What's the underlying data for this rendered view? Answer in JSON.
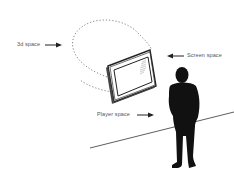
{
  "diagram": {
    "labels": {
      "space_3d": "3d space",
      "screen_space": "Screen space",
      "player_space": "Player space"
    },
    "elements": [
      "3d space dotted volume",
      "screen / monitor",
      "player silhouette",
      "floor line"
    ],
    "colors": {
      "background": "#ffffff",
      "ink": "#111111",
      "label_text": "#555555",
      "dotted_outline": "#777777"
    }
  }
}
